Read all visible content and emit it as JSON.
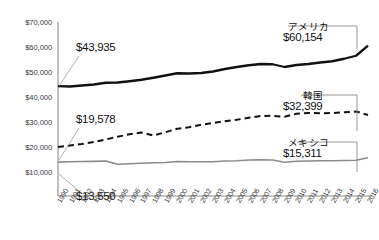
{
  "chart_data": {
    "type": "line",
    "title": "",
    "xlabel": "",
    "ylabel": "",
    "grid": false,
    "legend_position": "right-callout",
    "ylim": [
      0,
      70000
    ],
    "yticks": [
      "$10,000",
      "$20,000",
      "$30,000",
      "$40,000",
      "$50,000",
      "$60,000",
      "$70,000"
    ],
    "ytick_values": [
      10000,
      20000,
      30000,
      40000,
      50000,
      60000,
      70000
    ],
    "x": [
      1990,
      1991,
      1992,
      1993,
      1994,
      1995,
      1996,
      1997,
      1998,
      1999,
      2000,
      2001,
      2002,
      2003,
      2004,
      2005,
      2006,
      2007,
      2008,
      2009,
      2010,
      2011,
      2012,
      2013,
      2014,
      2015,
      2016
    ],
    "categories": [
      "1990",
      "1991",
      "1992",
      "1993",
      "1994",
      "1995",
      "1996",
      "1997",
      "1998",
      "1999",
      "2000",
      "2001",
      "2002",
      "2003",
      "2004",
      "2005",
      "2006",
      "2007",
      "2008",
      "2009",
      "2010",
      "2011",
      "2012",
      "2013",
      "2014",
      "2015",
      "2016"
    ],
    "series": [
      {
        "name": "アメリカ",
        "style": "solid",
        "color": "#111111",
        "start_value": 43935,
        "end_value": 60154,
        "start_label": "$43,935",
        "end_label": "$60,154",
        "values": [
          43935,
          43800,
          44200,
          44600,
          45300,
          45400,
          45900,
          46500,
          47300,
          48200,
          49100,
          49000,
          49200,
          49800,
          50800,
          51600,
          52300,
          52800,
          52700,
          51600,
          52400,
          52800,
          53400,
          53900,
          54900,
          56100,
          60154
        ]
      },
      {
        "name": "韓国",
        "style": "dashed",
        "color": "#111111",
        "start_value": 19578,
        "end_value": 32399,
        "start_label": "$19,578",
        "end_label": "$32,399",
        "values": [
          19578,
          20200,
          20800,
          21600,
          22600,
          23700,
          24700,
          25400,
          24200,
          25500,
          26900,
          27500,
          28500,
          29200,
          29900,
          30500,
          31300,
          32000,
          32100,
          31700,
          32900,
          33200,
          33100,
          33200,
          33500,
          33800,
          32399
        ]
      },
      {
        "name": "メキシコ",
        "style": "solid",
        "color": "#8a8a8a",
        "start_value": 13550,
        "end_value": 15311,
        "start_label": "$13,550",
        "end_label": "$15,311",
        "values": [
          13550,
          13700,
          13800,
          13850,
          14000,
          12700,
          12900,
          13100,
          13300,
          13400,
          13800,
          13700,
          13700,
          13700,
          14000,
          14100,
          14400,
          14500,
          14400,
          13500,
          13900,
          14000,
          14100,
          14100,
          14200,
          14300,
          15311
        ]
      }
    ]
  },
  "axis": {
    "y_labels": [
      "$70,000",
      "$60,000",
      "$50,000",
      "$40,000",
      "$30,000",
      "$20,000",
      "$10,000"
    ],
    "x_labels": [
      "1990",
      "1991",
      "1992",
      "1993",
      "1994",
      "1995",
      "1996",
      "1997",
      "1998",
      "1999",
      "2000",
      "2001",
      "2002",
      "2003",
      "2004",
      "2005",
      "2006",
      "2007",
      "2008",
      "2009",
      "2010",
      "2011",
      "2012",
      "2013",
      "2014",
      "2015",
      "2016"
    ]
  },
  "callouts": {
    "us": {
      "name": "アメリカ",
      "value": "$60,154"
    },
    "korea": {
      "name": "韓国",
      "value": "$32,399"
    },
    "mexico": {
      "name": "メキシコ",
      "value": "$15,311"
    }
  },
  "start_labels": {
    "us": "$43,935",
    "korea": "$19,578",
    "mexico": "$13,550"
  },
  "colors": {
    "us_line": "#111111",
    "korea_line": "#111111",
    "mexico_line": "#8a8a8a",
    "axis": "#8c8c8c",
    "text": "#333333"
  }
}
